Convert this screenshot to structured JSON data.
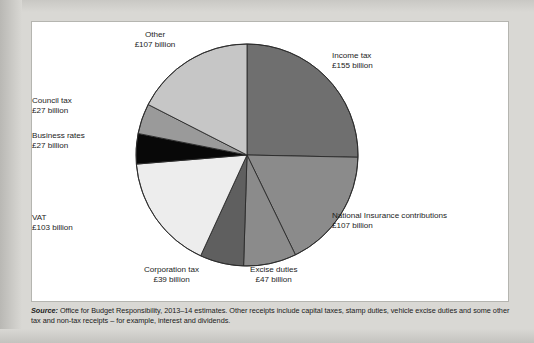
{
  "chart_data": {
    "type": "pie",
    "title": "",
    "subtitle": "",
    "xlabel": "",
    "ylabel": "",
    "units": "£ billion",
    "total": 612,
    "legend_position": "callout-labels",
    "grid": false,
    "start_angle_deg": 0,
    "direction": "clockwise",
    "categories": [
      "Income tax",
      "National Insurance contributions",
      "Excise duties",
      "Corporation tax",
      "VAT",
      "Business rates",
      "Council tax",
      "Other"
    ],
    "values": [
      155,
      107,
      47,
      39,
      103,
      27,
      27,
      107
    ],
    "slices": [
      {
        "label": "Income tax",
        "value_label": "£155 billion",
        "value": 155,
        "color": "#6f6f6f"
      },
      {
        "label": "National Insurance contributions",
        "value_label": "£107 billion",
        "value": 107,
        "color": "#8b8b8b"
      },
      {
        "label": "Excise duties",
        "value_label": "£47 billion",
        "value": 47,
        "color": "#8b8b8b"
      },
      {
        "label": "Corporation tax",
        "value_label": "£39 billion",
        "value": 39,
        "color": "#5f5f5f"
      },
      {
        "label": "VAT",
        "value_label": "£103 billion",
        "value": 103,
        "color": "#ededed"
      },
      {
        "label": "Business rates",
        "value_label": "£27 billion",
        "value": 27,
        "color": "#080808"
      },
      {
        "label": "Council tax",
        "value_label": "£27 billion",
        "value": 27,
        "color": "#9a9a9a"
      },
      {
        "label": "Other",
        "value_label": "£107 billion",
        "value": 107,
        "color": "#c6c6c6"
      }
    ]
  },
  "source": {
    "prefix": "Source:",
    "text": " Office for Budget Responsibility, 2013–14 estimates. Other receipts include capital taxes, stamp duties, vehicle excise duties and some other tax and non-tax receipts – for example, interest and dividends."
  },
  "colors": {
    "page_background": "#d9d8d4",
    "panel_background": "#ffffff",
    "panel_border": "#b5b5b0",
    "slice_outline": "#2a2a2a",
    "text": "#1c1c1c"
  }
}
